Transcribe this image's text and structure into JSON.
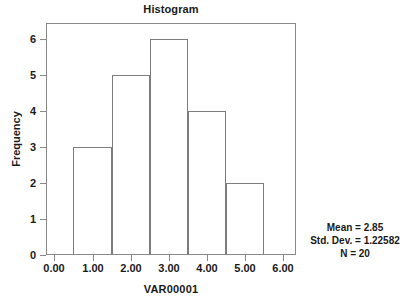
{
  "chart_data": {
    "type": "bar",
    "title": "Histogram",
    "xlabel": "VAR00001",
    "ylabel": "Frequency",
    "grid": false,
    "legend": "none",
    "xlim": [
      -0.22,
      6.33
    ],
    "ylim": [
      0,
      6.44
    ],
    "x_ticks": [
      "0.00",
      "1.00",
      "2.00",
      "3.00",
      "4.00",
      "5.00",
      "6.00"
    ],
    "x_tick_values": [
      0,
      1,
      2,
      3,
      4,
      5,
      6
    ],
    "y_ticks": [
      "0",
      "1",
      "2",
      "3",
      "4",
      "5",
      "6"
    ],
    "y_tick_values": [
      0,
      1,
      2,
      3,
      4,
      5,
      6
    ],
    "bin_width": 1,
    "bin_edges": [
      0.5,
      1.5,
      2.5,
      3.5,
      4.5,
      5.5
    ],
    "categories": [
      "0.5-1.5",
      "1.5-2.5",
      "2.5-3.5",
      "3.5-4.5",
      "4.5-5.5"
    ],
    "bin_centers": [
      1,
      2,
      3,
      4,
      5
    ],
    "values": [
      3,
      5,
      6,
      4,
      2
    ],
    "bar_edge_color": "#7d7d7d",
    "bar_fill_color": "transparent",
    "frame_color": "#8a8a8a",
    "text_color": "#1a1a1a",
    "background_color": "#ffffff"
  },
  "statistics": {
    "mean_line": "Mean = 2.85",
    "std_dev_line": "Std. Dev. = 1.22582",
    "n_line": "N = 20"
  }
}
